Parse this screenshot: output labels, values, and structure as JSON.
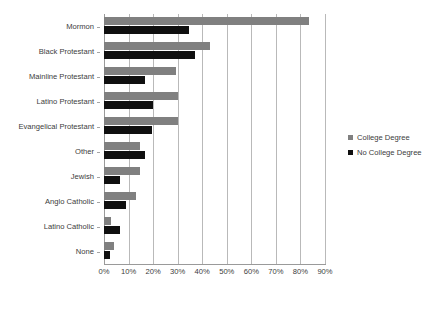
{
  "chart_data": {
    "type": "bar",
    "orientation": "horizontal",
    "title": "",
    "subtitle": "",
    "xlabel": "",
    "ylabel": "",
    "xlim": [
      0,
      90
    ],
    "xticks": [
      0,
      10,
      20,
      30,
      40,
      50,
      60,
      70,
      80,
      90
    ],
    "xtick_labels": [
      "0%",
      "10%",
      "20%",
      "30%",
      "40%",
      "50%",
      "60%",
      "70%",
      "80%",
      "90%"
    ],
    "grid": "vertical",
    "legend_position": "right",
    "categories": [
      "Mormon",
      "Black Protestant",
      "Mainline Protestant",
      "Latino Protestant",
      "Evangelical Protestant",
      "Other",
      "Jewish",
      "Anglo Catholic",
      "Latino Catholic",
      "None"
    ],
    "series": [
      {
        "name": "College Degree",
        "color": "#808080",
        "values": [
          83.5,
          43.0,
          29.5,
          30.0,
          30.0,
          14.5,
          14.5,
          13.0,
          3.0,
          4.0
        ]
      },
      {
        "name": "No College Degree",
        "color": "#101010",
        "values": [
          34.5,
          37.0,
          16.5,
          20.0,
          19.5,
          16.5,
          6.5,
          9.0,
          6.5,
          2.5
        ]
      }
    ]
  },
  "legend": {
    "items": [
      {
        "label": "College Degree",
        "color": "#808080"
      },
      {
        "label": "No College Degree",
        "color": "#101010"
      }
    ]
  }
}
